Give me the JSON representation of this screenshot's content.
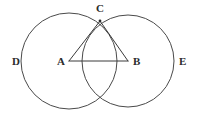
{
  "figure": {
    "canvas": {
      "width": 201,
      "height": 124,
      "background": "#ffffff"
    },
    "stroke_color": "#4a4a4a",
    "segment_color": "#3a3a3a",
    "label_color": "#2b2b2b",
    "circles": [
      {
        "id": "circle-left",
        "center_label": "A",
        "cx": 69,
        "cy": 61,
        "r": 48
      },
      {
        "id": "circle-right",
        "center_label": "B",
        "cx": 128,
        "cy": 61,
        "r": 46
      }
    ],
    "points": [
      {
        "id": "point-a",
        "label": "A",
        "x": 69,
        "y": 61,
        "label_x": 57,
        "label_y": 56
      },
      {
        "id": "point-b",
        "label": "B",
        "x": 128,
        "y": 61,
        "label_x": 133,
        "label_y": 56
      },
      {
        "id": "point-c",
        "label": "C",
        "x": 100,
        "y": 21,
        "label_x": 96,
        "label_y": 3
      },
      {
        "id": "point-d",
        "label": "D",
        "x": 21,
        "y": 61,
        "label_x": 12,
        "label_y": 56
      },
      {
        "id": "point-e",
        "label": "E",
        "x": 174,
        "y": 61,
        "label_x": 179,
        "label_y": 56
      }
    ],
    "segments": [
      {
        "id": "segment-ab",
        "from": "A",
        "to": "B",
        "x1": 69,
        "y1": 61,
        "x2": 128,
        "y2": 61
      },
      {
        "id": "segment-ac",
        "from": "A",
        "to": "C",
        "x1": 69,
        "y1": 61,
        "x2": 100,
        "y2": 21
      },
      {
        "id": "segment-bc",
        "from": "B",
        "to": "C",
        "x1": 128,
        "y1": 61,
        "x2": 100,
        "y2": 21
      }
    ],
    "intersection_points": [
      {
        "id": "intersection-top",
        "label": "C",
        "x": 100,
        "y": 21
      },
      {
        "id": "intersection-bottom",
        "label": "",
        "x": 99,
        "y": 104
      }
    ]
  }
}
